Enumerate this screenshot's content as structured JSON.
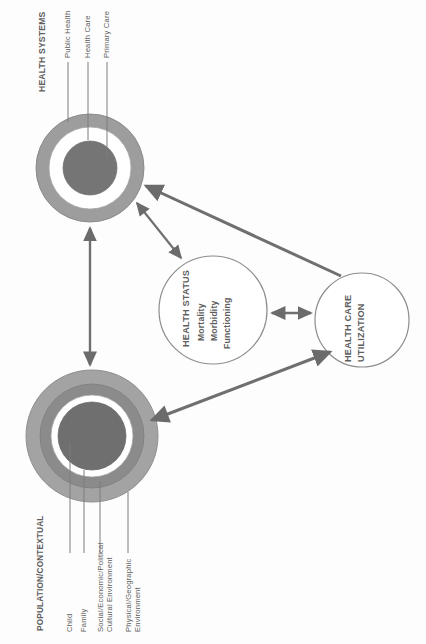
{
  "diagram": {
    "orientation": "rotated-90",
    "colors": {
      "text": "#5e5e5e",
      "arrow": "#6b6b6b",
      "ring_light": "#9a9a9a",
      "ring_mid": "#8a8a8a",
      "ring_dark": "#7b7b7b",
      "core_dark": "#6f6f6f",
      "gap_white": "#ffffff",
      "outline": "#808080"
    },
    "nodes": {
      "health_systems": {
        "heading": "HEALTH SYSTEMS",
        "shape": "concentric-rings",
        "ring_labels": [
          "Public Health",
          "Health Care",
          "Primary Care"
        ]
      },
      "population_contextual": {
        "heading": "POPULATION/CONTEXTUAL",
        "shape": "concentric-rings",
        "ring_labels": [
          "Child",
          "Family",
          "Social/Economic/Political\nCultural Environment",
          "Physical/Geographic\nEnvironment"
        ]
      },
      "health_status": {
        "heading": "HEALTH STATUS",
        "shape": "circle",
        "items": [
          "Mortality",
          "Morbidity",
          "Functioning"
        ]
      },
      "health_care_utilization": {
        "heading_line1": "HEALTH CARE",
        "heading_line2": "UTILIZATION",
        "shape": "circle"
      }
    },
    "connectors": [
      {
        "name": "population-to-health-systems",
        "style": "double-headed",
        "from": "population_contextual",
        "to": "health_systems"
      },
      {
        "name": "health-systems-to-health-status",
        "style": "double-headed",
        "from": "health_systems",
        "to": "health_status"
      },
      {
        "name": "health-status-to-utilization",
        "style": "double-headed",
        "from": "health_status",
        "to": "health_care_utilization"
      },
      {
        "name": "utilization-to-health-systems",
        "style": "single-headed",
        "from": "health_care_utilization",
        "to": "health_systems"
      },
      {
        "name": "population-to-utilization",
        "style": "double-headed",
        "from": "population_contextual",
        "to": "health_care_utilization"
      }
    ]
  }
}
